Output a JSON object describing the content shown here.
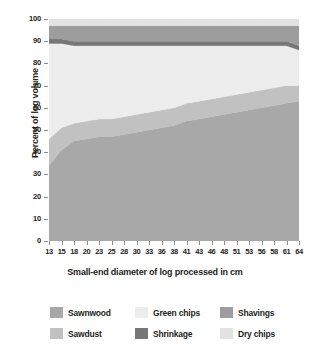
{
  "chart_data": {
    "type": "area",
    "stacked": true,
    "title": "",
    "xlabel": "Small-end diameter of log processed in cm",
    "ylabel": "Percent of log volume",
    "ylim": [
      0,
      100
    ],
    "yticks": [
      0,
      10,
      20,
      30,
      40,
      50,
      60,
      70,
      80,
      90,
      100
    ],
    "grid": false,
    "legend_position": "bottom",
    "x": [
      13,
      15,
      18,
      20,
      23,
      25,
      28,
      30,
      33,
      36,
      38,
      41,
      43,
      46,
      48,
      51,
      53,
      56,
      58,
      61,
      64
    ],
    "categories": [
      "13",
      "15",
      "18",
      "20",
      "23",
      "25",
      "28",
      "30",
      "33",
      "36",
      "38",
      "41",
      "43",
      "46",
      "48",
      "51",
      "53",
      "56",
      "58",
      "61",
      "64"
    ],
    "series": [
      {
        "name": "Sawnwood",
        "color": "#a8a8a8",
        "values": [
          34,
          41,
          45,
          46,
          47,
          47,
          48,
          49,
          50,
          51,
          52,
          54,
          55,
          56,
          57,
          58,
          59,
          60,
          61,
          62,
          63
        ]
      },
      {
        "name": "Sawdust",
        "color": "#c1c1c1",
        "values": [
          12,
          10,
          8,
          8,
          8,
          8,
          8,
          8,
          8,
          8,
          8,
          8,
          8,
          8,
          8,
          8,
          8,
          8,
          8,
          8,
          7
        ]
      },
      {
        "name": "Green chips",
        "color": "#ededed",
        "values": [
          43,
          38,
          35,
          34,
          33,
          33,
          32,
          31,
          30,
          29,
          28,
          26,
          25,
          24,
          23,
          22,
          21,
          20,
          19,
          18,
          16
        ]
      },
      {
        "name": "Shrinkage",
        "color": "#777777",
        "values": [
          2,
          2,
          2,
          2,
          2,
          2,
          2,
          2,
          2,
          2,
          2,
          2,
          2,
          2,
          2,
          2,
          2,
          2,
          2,
          2,
          2
        ]
      },
      {
        "name": "Shavings",
        "color": "#9d9d9d",
        "values": [
          6,
          6,
          7,
          7,
          7,
          7,
          7,
          7,
          7,
          7,
          7,
          7,
          7,
          7,
          7,
          7,
          7,
          7,
          7,
          7,
          9
        ]
      },
      {
        "name": "Dry chips",
        "color": "#e2e2e2",
        "values": [
          3,
          3,
          3,
          3,
          3,
          3,
          3,
          3,
          3,
          3,
          3,
          3,
          3,
          3,
          3,
          3,
          3,
          3,
          3,
          3,
          3
        ]
      }
    ]
  },
  "legend": {
    "entries": [
      {
        "label": "Sawnwood",
        "color": "#a8a8a8"
      },
      {
        "label": "Green chips",
        "color": "#ededed"
      },
      {
        "label": "Shavings",
        "color": "#9d9d9d"
      },
      {
        "label": "Sawdust",
        "color": "#c1c1c1"
      },
      {
        "label": "Shrinkage",
        "color": "#777777"
      },
      {
        "label": "Dry chips",
        "color": "#e2e2e2"
      }
    ]
  },
  "axes": {
    "y_title": "Percent of log volume",
    "x_title": "Small-end diameter of log processed in cm",
    "y_ticks": [
      "0",
      "10",
      "20",
      "30",
      "40",
      "50",
      "60",
      "70",
      "80",
      "90",
      "100"
    ],
    "x_ticks": [
      "13",
      "15",
      "18",
      "20",
      "23",
      "25",
      "28",
      "30",
      "33",
      "36",
      "38",
      "41",
      "43",
      "46",
      "48",
      "51",
      "53",
      "56",
      "58",
      "61",
      "64"
    ],
    "axis_color": "#8d8d8d"
  }
}
